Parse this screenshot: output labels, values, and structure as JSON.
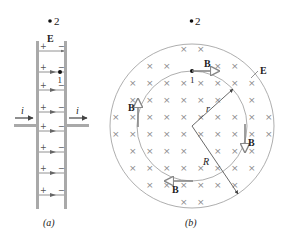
{
  "figure_a": {
    "caption": "(a)",
    "field_label": "E",
    "point_2_label": "2",
    "point_1_label": "1",
    "current_left_label": "i",
    "current_right_label": "i",
    "plus_sign": "+",
    "minus_sign": "−",
    "field_line_count": 7
  },
  "figure_b": {
    "caption": "(b)",
    "field_label": "E",
    "point_2_label": "2",
    "point_1_label": "1",
    "magnetic_field_label": "B",
    "radius_small_label": "r",
    "radius_large_label": "R",
    "into_page_symbol": "×"
  },
  "colors": {
    "plate": "#a9a9a9",
    "line": "#888888",
    "arrow": "#555555",
    "text": "#222222"
  }
}
